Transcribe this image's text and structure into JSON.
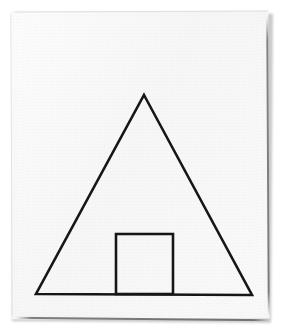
{
  "scene": {
    "medium": "scanned hand-drawn ink line figure on white paper",
    "subject": "house-like pictogram: large isosceles triangle with small rectangle at its base",
    "background_color": "#ffffff",
    "paper_color": "#fafafa",
    "ink_color": "#171717",
    "shadow_color": "#b9b9b9"
  },
  "paper": {
    "name": "paper-sheet",
    "x": 11,
    "y": 11,
    "width": 258,
    "height": 308,
    "rotation_deg": -0.25
  },
  "figure": {
    "stroke_color": "#171717",
    "stroke_width": 2.6,
    "shapes": [
      {
        "name": "triangle",
        "type": "polygon",
        "label": "isosceles triangle (roof / tent)",
        "points": [
          [
            144,
            95
          ],
          [
            252,
            295
          ],
          [
            36,
            294
          ]
        ],
        "closed": true
      },
      {
        "name": "rectangle",
        "type": "polygon",
        "label": "small rectangle (door) resting on the triangle base",
        "points": [
          [
            116,
            234
          ],
          [
            173,
            234
          ],
          [
            173,
            294
          ],
          [
            116,
            294
          ]
        ],
        "closed": true
      }
    ]
  },
  "chart_data": {
    "type": "line",
    "title": "",
    "xlabel": "",
    "ylabel": "",
    "xlim": [
      0,
      284
    ],
    "ylim": [
      334,
      0
    ],
    "grid": false,
    "legend": "none",
    "series": [
      {
        "name": "triangle",
        "x": [
          144,
          252,
          36,
          144
        ],
        "y": [
          95,
          295,
          294,
          95
        ]
      },
      {
        "name": "rectangle",
        "x": [
          116,
          173,
          173,
          116,
          116
        ],
        "y": [
          234,
          234,
          294,
          294,
          234
        ]
      }
    ]
  }
}
